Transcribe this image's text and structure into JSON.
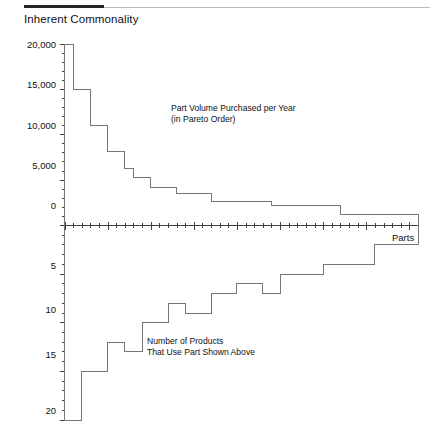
{
  "header": {
    "title": "Inherent Commonality"
  },
  "chart_data": {
    "type": "line",
    "title": "Inherent Commonality",
    "xlabel": "Parts",
    "grid": false,
    "legend_position": "none",
    "x_axis": {
      "label": "Parts",
      "n_parts": 41,
      "minor_tick_every": 1,
      "major_tick_every": 5
    },
    "panels": [
      {
        "name": "part-volume-panel",
        "position": "top",
        "annotation": "Part Volume Purchased per Year\n(in Pareto Order)",
        "ylabel": "",
        "ylim": [
          0,
          20000
        ],
        "ytick_labels": [
          "20,000",
          "15,000",
          "10,000",
          "5,000",
          "0"
        ],
        "ytick_values": [
          20000,
          15000,
          10000,
          5000,
          0
        ],
        "minor_ytick_step": 1000,
        "direction": "descending",
        "step_values": [
          20000,
          15000,
          15000,
          11000,
          11000,
          8200,
          8200,
          6300,
          5300,
          5300,
          4200,
          4200,
          4200,
          3500,
          3500,
          3500,
          3500,
          2700,
          2700,
          2700,
          2700,
          2700,
          2700,
          2700,
          2200,
          2200,
          2200,
          2200,
          2200,
          2200,
          2200,
          2200,
          1200,
          1200,
          1200,
          1200,
          1200,
          1200,
          1200,
          1200,
          1200
        ]
      },
      {
        "name": "product-count-panel",
        "position": "bottom",
        "annotation": "Number of Products\nThat Use Part Shown Above",
        "ylabel": "",
        "ylim": [
          0,
          20
        ],
        "ytick_labels": [
          "0",
          "5",
          "10",
          "15",
          "20"
        ],
        "ytick_values": [
          0,
          5,
          10,
          15,
          20
        ],
        "minor_ytick_step": 1,
        "axis_inverted": true,
        "direction": "ascending",
        "step_values": [
          20,
          20,
          15,
          15,
          15,
          12,
          12,
          13,
          13,
          10,
          10,
          10,
          8,
          8,
          9,
          9,
          9,
          7,
          7,
          7,
          6,
          6,
          6,
          7,
          7,
          5,
          5,
          5,
          5,
          5,
          4,
          4,
          4,
          4,
          4,
          4,
          2,
          2,
          2,
          2,
          2
        ]
      }
    ]
  }
}
